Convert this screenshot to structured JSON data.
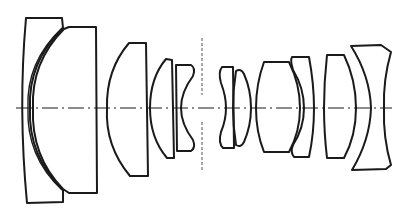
{
  "diagram": {
    "type": "optical-lens-cross-section",
    "background": "#ffffff",
    "stroke_color": "#1a1a1a",
    "optical_axis": {
      "y": 108,
      "style": "dash-dot"
    },
    "aperture_stop": {
      "x": 202,
      "style": "dashed"
    },
    "element_count": 11,
    "groups": [
      {
        "name": "front-meniscus-group",
        "elements": [
          "E1",
          "E2"
        ]
      },
      {
        "name": "positive-element",
        "elements": [
          "E3"
        ]
      },
      {
        "name": "pre-stop-cemented-group",
        "elements": [
          "E4",
          "E5"
        ]
      },
      {
        "name": "post-stop-cemented-group",
        "elements": [
          "E6",
          "E7"
        ]
      },
      {
        "name": "rear-cemented-group",
        "elements": [
          "E8",
          "E9"
        ]
      },
      {
        "name": "positive-element-rear",
        "elements": [
          "E10"
        ]
      },
      {
        "name": "rear-negative-meniscus",
        "elements": [
          "E11"
        ]
      }
    ],
    "labels": []
  }
}
